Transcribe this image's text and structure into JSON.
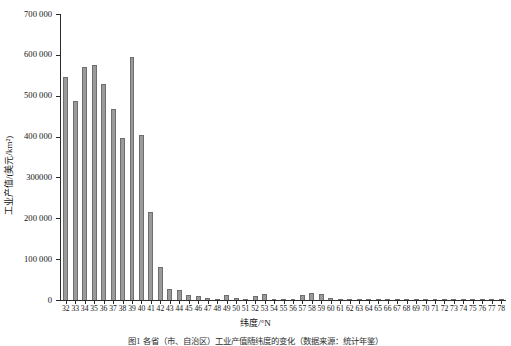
{
  "chart_data": {
    "type": "bar",
    "title": "",
    "xlabel": "纬度/°N",
    "ylabel": "工业产值/(美元/km²)",
    "ylim": [
      0,
      700000
    ],
    "ytick_values": [
      0,
      100000,
      200000,
      300000,
      400000,
      500000,
      600000,
      700000
    ],
    "ytick_labels": [
      "0",
      "100 000",
      "200 000",
      "300000",
      "400 000",
      "500 000",
      "600 000",
      "700 000"
    ],
    "grid": false,
    "legend": null,
    "bar_color": "#9a9a9a",
    "bar_edge_color": "#6e6e6e",
    "categories": [
      "32",
      "33",
      "34",
      "35",
      "36",
      "37",
      "38",
      "39",
      "40",
      "41",
      "42",
      "43",
      "44",
      "45",
      "46",
      "47",
      "48",
      "49",
      "50",
      "51",
      "52",
      "53",
      "54",
      "55",
      "56",
      "57",
      "58",
      "59",
      "60",
      "61",
      "62",
      "63",
      "64",
      "65",
      "66",
      "67",
      "68",
      "69",
      "70",
      "71",
      "72",
      "73",
      "74",
      "75",
      "76",
      "77",
      "78"
    ],
    "values": [
      545000,
      487000,
      570000,
      575000,
      528000,
      468000,
      396000,
      594000,
      405000,
      215000,
      82000,
      27000,
      24000,
      12000,
      9000,
      4000,
      3000,
      12000,
      4000,
      3000,
      9000,
      14000,
      3000,
      2000,
      2000,
      12000,
      16000,
      15000,
      4000,
      3000,
      2000,
      2000,
      1500,
      1500,
      1000,
      1000,
      1000,
      800,
      800,
      600,
      600,
      500,
      500,
      400,
      400,
      300,
      300
    ]
  },
  "axis": {
    "y_axis_label": "工业产值/(美元/km²)",
    "x_axis_label": "纬度/°N"
  },
  "caption": {
    "text": "图1  各省（市、自治区）工业产值随纬度的变化（数据来源：统计年鉴）"
  }
}
